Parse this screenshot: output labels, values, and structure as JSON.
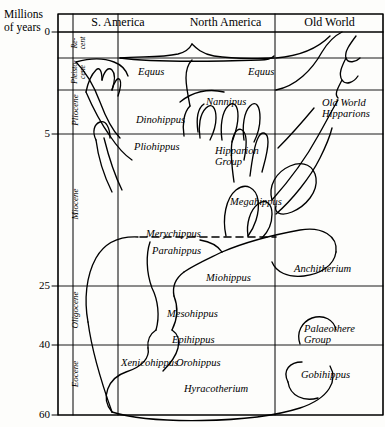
{
  "axis": {
    "title_line1": "Millions",
    "title_line2": "of years",
    "ticks": [
      {
        "value": "0",
        "y": 32
      },
      {
        "value": "5",
        "y": 134
      },
      {
        "value": "25",
        "y": 286
      },
      {
        "value": "40",
        "y": 345
      },
      {
        "value": "60",
        "y": 415
      }
    ]
  },
  "epoch_column_header": "S.",
  "epochs": [
    {
      "name": "Re-",
      "name2": "cent",
      "top": 32,
      "bottom": 58
    },
    {
      "name": "Pleisto-",
      "name2": "cene",
      "top": 58,
      "bottom": 90
    },
    {
      "name": "Pliocene",
      "name2": "",
      "top": 90,
      "bottom": 134
    },
    {
      "name": "Miocene",
      "name2": "",
      "top": 134,
      "bottom": 286
    },
    {
      "name": "Oligocene",
      "name2": "",
      "top": 286,
      "bottom": 345
    },
    {
      "name": "Eocene",
      "name2": "",
      "top": 345,
      "bottom": 415
    }
  ],
  "regions": [
    {
      "label": "S. America",
      "x": 74,
      "w": 88
    },
    {
      "label": "North America",
      "x": 148,
      "w": 155
    },
    {
      "label": "Old World",
      "x": 276,
      "w": 107
    }
  ],
  "taxa": [
    {
      "name": "Equus",
      "x": 138,
      "y": 66,
      "region": "north-america"
    },
    {
      "name": "Equus",
      "x": 248,
      "y": 66,
      "region": "old-world"
    },
    {
      "name": "Nannipus",
      "x": 206,
      "y": 96,
      "region": "north-america"
    },
    {
      "name": "Dinohippus",
      "x": 136,
      "y": 114,
      "region": "north-america"
    },
    {
      "name": "Old World",
      "name2": "Hipparions",
      "x": 322,
      "y": 97,
      "region": "old-world"
    },
    {
      "name": "Pliohippus",
      "x": 134,
      "y": 141,
      "region": "north-america"
    },
    {
      "name": "Hipparion",
      "name2": "Group",
      "x": 215,
      "y": 145,
      "region": "north-america"
    },
    {
      "name": "Megahippus",
      "x": 230,
      "y": 196,
      "region": "north-america"
    },
    {
      "name": "Merychippus",
      "x": 146,
      "y": 228,
      "region": "north-america"
    },
    {
      "name": "Parahippus",
      "x": 152,
      "y": 245,
      "region": "north-america"
    },
    {
      "name": "Anchitherium",
      "x": 294,
      "y": 263,
      "region": "old-world"
    },
    {
      "name": "Miohippus",
      "x": 206,
      "y": 272,
      "region": "north-america"
    },
    {
      "name": "Mesohippus",
      "x": 167,
      "y": 308,
      "region": "north-america"
    },
    {
      "name": "Epihippus",
      "x": 172,
      "y": 334,
      "region": "north-america"
    },
    {
      "name": "Palaeothere",
      "name2": "Group",
      "x": 304,
      "y": 323,
      "region": "old-world"
    },
    {
      "name": "Xenicohippus",
      "x": 121,
      "y": 357,
      "region": "north-america"
    },
    {
      "name": "Orohippus",
      "x": 176,
      "y": 357,
      "region": "north-america"
    },
    {
      "name": "Gobihippus",
      "x": 301,
      "y": 369,
      "region": "old-world"
    },
    {
      "name": "Hyracotherium",
      "x": 184,
      "y": 383,
      "region": "north-america"
    }
  ],
  "chart_data": {
    "type": "line",
    "ylabel": "Millions of years",
    "ylim": [
      0,
      60
    ],
    "yticks": [
      0,
      5,
      25,
      40,
      60
    ],
    "y_axis_inverted": true,
    "grid": true,
    "legend": "none",
    "columns": [
      "S. America",
      "North America",
      "Old World"
    ],
    "epoch_bands": [
      {
        "epoch": "Recent",
        "from": 0,
        "to": 1.5
      },
      {
        "epoch": "Pleistocene",
        "from": 1.5,
        "to": 3.3
      },
      {
        "epoch": "Pliocene",
        "from": 3.3,
        "to": 5
      },
      {
        "epoch": "Miocene",
        "from": 5,
        "to": 25
      },
      {
        "epoch": "Oligocene",
        "from": 25,
        "to": 40
      },
      {
        "epoch": "Eocene",
        "from": 40,
        "to": 60
      }
    ],
    "annotations": [
      "Equus",
      "Equus",
      "Nannipus",
      "Dinohippus",
      "Old World Hipparions",
      "Pliohippus",
      "Hipparion Group",
      "Megahippus",
      "Merychippus",
      "Parahippus",
      "Anchitherium",
      "Miohippus",
      "Mesohippus",
      "Epihippus",
      "Palaeothere Group",
      "Xenicohippus",
      "Orohippus",
      "Gobihippus",
      "Hyracotherium"
    ]
  }
}
